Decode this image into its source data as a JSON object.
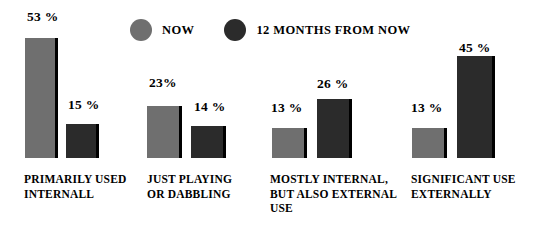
{
  "chart_data": {
    "type": "bar",
    "title": "",
    "subtitle": "",
    "xlabel": "",
    "ylabel": "",
    "ylim": [
      0,
      55
    ],
    "grid": false,
    "legend_position": "top",
    "categories": [
      "PRIMARILY USED INTERNALL",
      "JUST PLAYING OR DABBLING",
      "MOSTLY INTERNAL, BUT ALSO EXTERNAL USE",
      "SIGNIFICANT USE EXTERNALLY"
    ],
    "series": [
      {
        "name": "NOW",
        "color": "#6f6f6f",
        "values": [
          53,
          23,
          13,
          13
        ],
        "value_labels": [
          "53 %",
          "23%",
          "13 %",
          "13 %"
        ]
      },
      {
        "name": "12 MONTHS FROM NOW",
        "color": "#2b2b2b",
        "values": [
          15,
          14,
          26,
          45
        ],
        "value_labels": [
          "15 %",
          "14 %",
          "26 %",
          "45 %"
        ]
      }
    ]
  },
  "legend": {
    "items": [
      {
        "label": "NOW",
        "swatch": "now-swatch-icon"
      },
      {
        "label": "12 MONTHS FROM NOW",
        "swatch": "future-swatch-icon"
      }
    ]
  },
  "category_label_lines": [
    [
      "PRIMARILY USED",
      "INTERNALL"
    ],
    [
      "JUST PLAYING",
      "OR DABBLING"
    ],
    [
      "MOSTLY INTERNAL,",
      "BUT ALSO EXTERNAL",
      "USE"
    ],
    [
      "SIGNIFICANT USE",
      "EXTERNALLY"
    ]
  ],
  "colors": {
    "now": "#6f6f6f",
    "future": "#2b2b2b",
    "edge": "#000000",
    "background": "#ffffff",
    "text": "#000000"
  },
  "geometry": {
    "baseline_y": 158,
    "px_per_unit": 2.27,
    "groups": [
      {
        "now_x": 25,
        "now_w": 33,
        "future_x": 66,
        "future_w": 33
      },
      {
        "now_x": 147,
        "now_w": 35,
        "future_x": 191,
        "future_w": 35
      },
      {
        "now_x": 272,
        "now_w": 35,
        "future_x": 317,
        "future_w": 35
      },
      {
        "now_x": 412,
        "now_w": 35,
        "future_x": 457,
        "future_w": 38
      }
    ],
    "value_label_positions": [
      {
        "now_x": 27,
        "now_y": 10,
        "future_x": 68,
        "future_y": 98
      },
      {
        "now_x": 149,
        "now_y": 76,
        "future_x": 194,
        "future_y": 100
      },
      {
        "now_x": 271,
        "now_y": 101,
        "future_x": 317,
        "future_y": 77
      },
      {
        "now_x": 411,
        "now_y": 101,
        "future_x": 459,
        "future_y": 41
      }
    ],
    "category_label_positions": [
      {
        "x": 24,
        "y": 172
      },
      {
        "x": 147,
        "y": 172
      },
      {
        "x": 270,
        "y": 172
      },
      {
        "x": 411,
        "y": 172
      }
    ]
  }
}
